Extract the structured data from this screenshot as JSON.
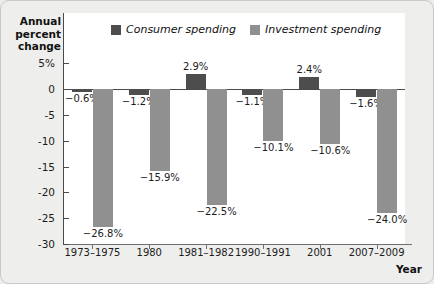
{
  "axis": {
    "y_title": "Annual percent change",
    "x_title": "Year",
    "y_ticks": [
      "5%",
      "0",
      "-5",
      "-10",
      "-15",
      "-20",
      "-25",
      "-30"
    ]
  },
  "legend": [
    {
      "label": "Consumer spending",
      "color": "#4d4d4d"
    },
    {
      "label": "Investment spending",
      "color": "#909090"
    }
  ],
  "chart_data": {
    "type": "bar",
    "title": "",
    "xlabel": "Year",
    "ylabel": "Annual percent change",
    "ylim": [
      -30,
      5
    ],
    "yticks": [
      5,
      0,
      -5,
      -10,
      -15,
      -20,
      -25,
      -30
    ],
    "grid": false,
    "legend_position": "top-center",
    "categories": [
      "1973–1975",
      "1980",
      "1981–1982",
      "1990–1991",
      "2001",
      "2007–2009"
    ],
    "series": [
      {
        "name": "Consumer spending",
        "color": "#4d4d4d",
        "values": [
          -0.6,
          -1.2,
          2.9,
          -1.1,
          2.4,
          -1.6
        ],
        "labels": [
          "−0.6%",
          "−1.2%",
          "2.9%",
          "−1.1%",
          "2.4%",
          "−1.6%"
        ]
      },
      {
        "name": "Investment spending",
        "color": "#909090",
        "values": [
          -26.8,
          -15.9,
          -22.5,
          -10.1,
          -10.6,
          -24.0
        ],
        "labels": [
          "−26.8%",
          "−15.9%",
          "−22.5%",
          "−10.1%",
          "−10.6%",
          "−24.0%"
        ]
      }
    ]
  }
}
